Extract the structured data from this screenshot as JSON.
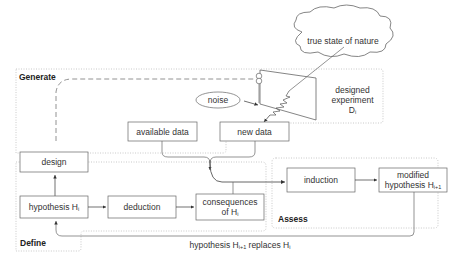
{
  "regions": {
    "generate": "Generate",
    "define": "Define",
    "assess": "Assess"
  },
  "nodes": {
    "cloud": "true state of nature",
    "noise": "noise",
    "experiment_line1": "designed",
    "experiment_line2": "experiment",
    "experiment_line3": "D",
    "experiment_sub": "i",
    "available_data": "available data",
    "new_data": "new data",
    "design": "design",
    "hypothesis": "hypothesis H",
    "hypothesis_sub": "i",
    "deduction": "deduction",
    "consequences_line1": "consequences",
    "consequences_line2": "of H",
    "consequences_sub": "i",
    "induction": "induction",
    "modified_line1": "modified",
    "modified_line2": "hypothesis H",
    "modified_sub": "i+1"
  },
  "edges": {
    "replace_label_a": "hypothesis H",
    "replace_sub_a": "i+1",
    "replace_label_b": " replaces H",
    "replace_sub_b": "i"
  },
  "colors": {
    "stroke": "#666666",
    "region_border": "#aaaaaa",
    "text": "#333333"
  }
}
